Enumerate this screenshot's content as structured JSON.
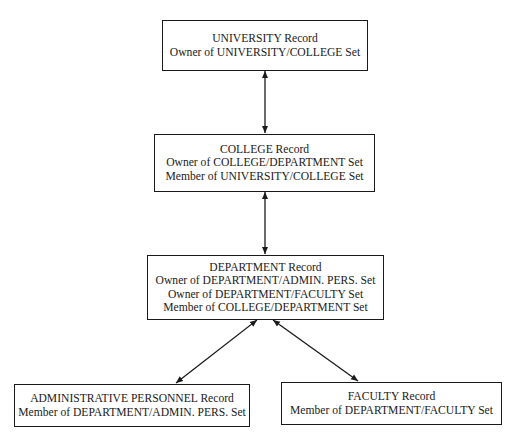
{
  "diagram": {
    "type": "network-database-schema",
    "colors": {
      "line": "#1a1a1a",
      "background": "#ffffff"
    },
    "records": [
      {
        "id": "university",
        "title": "UNIVERSITY Record",
        "lines": [
          "Owner of UNIVERSITY/COLLEGE Set"
        ]
      },
      {
        "id": "college",
        "title": "COLLEGE Record",
        "lines": [
          "Owner of COLLEGE/DEPARTMENT Set",
          "Member of UNIVERSITY/COLLEGE Set"
        ]
      },
      {
        "id": "department",
        "title": "DEPARTMENT Record",
        "lines": [
          "Owner of DEPARTMENT/ADMIN. PERS. Set",
          "Owner of DEPARTMENT/FACULTY Set",
          "Member of COLLEGE/DEPARTMENT Set"
        ]
      },
      {
        "id": "admin_personnel",
        "title": "ADMINISTRATIVE PERSONNEL Record",
        "lines": [
          "Member of DEPARTMENT/ADMIN. PERS. Set"
        ]
      },
      {
        "id": "faculty",
        "title": "FACULTY Record",
        "lines": [
          "Member of DEPARTMENT/FACULTY Set"
        ]
      }
    ],
    "connections": [
      {
        "from": "university",
        "to": "college",
        "style": "double-arrow"
      },
      {
        "from": "college",
        "to": "department",
        "style": "double-arrow"
      },
      {
        "from": "department",
        "to": "admin_personnel",
        "style": "double-arrow"
      },
      {
        "from": "department",
        "to": "faculty",
        "style": "double-arrow"
      }
    ]
  }
}
